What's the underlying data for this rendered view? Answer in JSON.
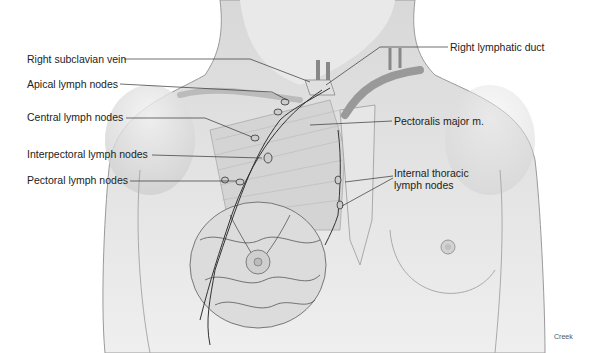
{
  "figure": {
    "credit": "Creek"
  },
  "labels": {
    "left": [
      {
        "id": "right_subclavian_vein",
        "text": "Right subclavian vein"
      },
      {
        "id": "apical_lymph_nodes",
        "text": "Apical lymph nodes"
      },
      {
        "id": "central_lymph_nodes",
        "text": "Central lymph nodes"
      },
      {
        "id": "interpectoral_lymph_nodes",
        "text": "Interpectoral lymph nodes"
      },
      {
        "id": "pectoral_lymph_nodes",
        "text": "Pectoral lymph nodes"
      }
    ],
    "right": [
      {
        "id": "right_lymphatic_duct",
        "text": "Right lymphatic duct"
      },
      {
        "id": "pectoralis_major",
        "text": "Pectoralis major m."
      },
      {
        "id": "internal_thoracic_line1",
        "text": "Internal thoracic"
      },
      {
        "id": "internal_thoracic_line2",
        "text": "lymph nodes"
      }
    ]
  },
  "colors": {
    "skin": "#e4e4e4",
    "outline": "#9a9a9a",
    "vessel": "#333333",
    "text": "#222222"
  }
}
